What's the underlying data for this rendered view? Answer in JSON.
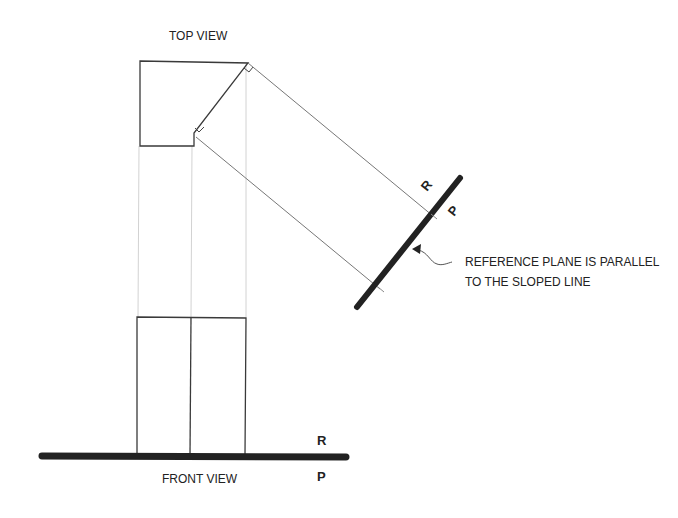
{
  "diagram": {
    "top_view": {
      "label": "TOP VIEW",
      "outline_points": "140,61 248,63 194,133 194,146 140,146"
    },
    "front_view": {
      "label": "FRONT VIEW",
      "rect": {
        "x1": 137,
        "y1": 317,
        "x2": 246,
        "y2": 455
      },
      "divider_x": 191
    },
    "reference_lines": {
      "horizontal": {
        "label_top": "R",
        "label_bottom": "P"
      },
      "sloped": {
        "label_top": "R",
        "label_bottom": "P"
      }
    },
    "annotation": {
      "line1": "REFERENCE PLANE IS PARALLEL",
      "line2": "TO THE SLOPED LINE"
    },
    "colors": {
      "outline": "#333333",
      "projector": "#cccccc",
      "projector_dark": "#666666",
      "reference_line": "#222222"
    }
  }
}
